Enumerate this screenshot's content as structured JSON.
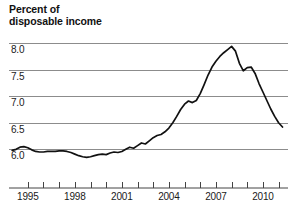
{
  "chart_data": {
    "type": "line",
    "title": "Percent of\ndisposable income",
    "xlabel": "",
    "ylabel": "",
    "grid": true,
    "legend": "none",
    "line_color": "#111111",
    "grid_color": "#8c8c8c",
    "xlim": [
      1993.8,
      2011.6
    ],
    "ylim": [
      5.78,
      8.06
    ],
    "yticks": [
      "6.0",
      "6.5",
      "7.0",
      "7.5",
      "8.0"
    ],
    "ytick_values": [
      6.0,
      6.5,
      7.0,
      7.5,
      8.0
    ],
    "xticks_labeled": [
      "1995",
      "1998",
      "2001",
      "2004",
      "2007",
      "2010"
    ],
    "xtick_values_labeled": [
      1995,
      1998,
      2001,
      2004,
      2007,
      2010
    ],
    "xtick_values_all": [
      1995,
      1996,
      1997,
      1998,
      1999,
      2000,
      2001,
      2002,
      2003,
      2004,
      2005,
      2006,
      2007,
      2008,
      2009,
      2010,
      2011
    ],
    "x": [
      1994.0,
      1994.25,
      1994.5,
      1994.75,
      1995.0,
      1995.25,
      1995.5,
      1995.75,
      1996.0,
      1996.25,
      1996.5,
      1996.75,
      1997.0,
      1997.25,
      1997.5,
      1997.75,
      1998.0,
      1998.25,
      1998.5,
      1998.75,
      1999.0,
      1999.25,
      1999.5,
      1999.75,
      2000.0,
      2000.25,
      2000.5,
      2000.75,
      2001.0,
      2001.25,
      2001.5,
      2001.75,
      2002.0,
      2002.25,
      2002.5,
      2002.75,
      2003.0,
      2003.25,
      2003.5,
      2003.75,
      2004.0,
      2004.25,
      2004.5,
      2004.75,
      2005.0,
      2005.25,
      2005.5,
      2005.75,
      2006.0,
      2006.25,
      2006.5,
      2006.75,
      2007.0,
      2007.25,
      2007.5,
      2007.75,
      2008.0,
      2008.25,
      2008.5,
      2008.75,
      2009.0,
      2009.25,
      2009.5,
      2009.75,
      2010.0,
      2010.25,
      2010.5,
      2010.75,
      2011.0,
      2011.25
    ],
    "values": [
      5.98,
      6.0,
      6.04,
      6.05,
      6.03,
      5.99,
      5.96,
      5.95,
      5.95,
      5.96,
      5.96,
      5.96,
      5.97,
      5.97,
      5.96,
      5.94,
      5.91,
      5.88,
      5.86,
      5.85,
      5.86,
      5.88,
      5.9,
      5.91,
      5.9,
      5.93,
      5.95,
      5.94,
      5.96,
      6.0,
      6.04,
      6.02,
      6.07,
      6.12,
      6.1,
      6.16,
      6.22,
      6.26,
      6.28,
      6.33,
      6.4,
      6.5,
      6.62,
      6.75,
      6.85,
      6.91,
      6.88,
      6.92,
      7.05,
      7.22,
      7.4,
      7.55,
      7.66,
      7.75,
      7.82,
      7.88,
      7.94,
      7.85,
      7.62,
      7.48,
      7.54,
      7.55,
      7.43,
      7.24,
      7.08,
      6.92,
      6.76,
      6.62,
      6.5,
      6.42
    ],
    "peak": {
      "x": 2008.0,
      "y": 7.94
    },
    "trough": {
      "x": 1998.75,
      "y": 5.85
    },
    "end": {
      "x": 2011.25,
      "y": 6.42
    }
  }
}
